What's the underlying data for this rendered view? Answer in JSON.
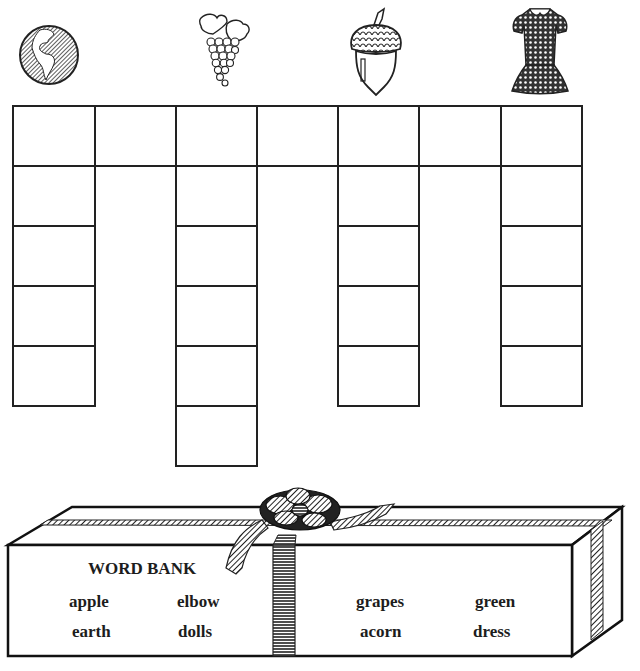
{
  "worksheet": {
    "pictures": [
      {
        "name": "earth",
        "icon": "globe-icon",
        "column": 1
      },
      {
        "name": "grapes",
        "icon": "grapes-icon",
        "column": 3
      },
      {
        "name": "acorn",
        "icon": "acorn-icon",
        "column": 5
      },
      {
        "name": "dress",
        "icon": "dress-icon",
        "column": 7
      }
    ],
    "crossword": {
      "top_row_cells": 7,
      "columns": [
        {
          "column": 1,
          "cells": 5
        },
        {
          "column": 3,
          "cells": 6
        },
        {
          "column": 5,
          "cells": 5
        },
        {
          "column": 7,
          "cells": 5
        }
      ]
    },
    "word_bank": {
      "title": "WORD BANK",
      "words": {
        "apple": "apple",
        "elbow": "elbow",
        "earth": "earth",
        "dolls": "dolls",
        "grapes": "grapes",
        "green": "green",
        "acorn": "acorn",
        "dress": "dress"
      }
    },
    "colors": {
      "ink": "#1d1d1d",
      "paper": "#ffffff"
    }
  }
}
